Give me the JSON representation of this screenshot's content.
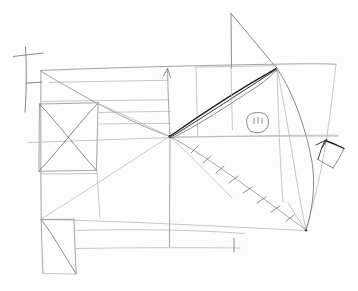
{
  "document": {
    "title": "Hand-drawn geometric sketch",
    "medium": "pencil on paper",
    "width": 358,
    "height": 291,
    "background_color": "#fdfdfc",
    "caption": ""
  },
  "palette": {
    "paper": "#fdfdfc",
    "pencil_light": "#b4b4b6",
    "pencil_mid": "#8e8e90",
    "pencil_strong": "#3a3a3c",
    "pencil_darkest": "#1d1d1f"
  },
  "shapes": {
    "cross": {
      "label": "cross / crucifix mark",
      "vertical": [
        25,
        48,
        27,
        112
      ],
      "horizontal": [
        14,
        56,
        43,
        53
      ],
      "crossbar_low": [
        26,
        83,
        42,
        82
      ]
    },
    "main_body": {
      "label": "large quadrilateral body",
      "points": "41,70 336,64 308,230 41,219"
    },
    "upper_square": {
      "label": "left square with X",
      "points": "40,104 98,103 96,170 39,171",
      "diagonals": [
        [
          40,
          104,
          96,
          170
        ],
        [
          98,
          103,
          39,
          171
        ]
      ]
    },
    "lower_square": {
      "label": "lower-left rectangle with diagonal",
      "points": "41,219 74,219 76,274 43,273",
      "diagonal": [
        41,
        219,
        76,
        274
      ]
    },
    "sail_triangle": {
      "label": "upper-right triangle (sail/fin)",
      "points": "231,13 277,68 231,68"
    },
    "tail": {
      "label": "small dark quadrilateral tail at right",
      "points": "330,143 345,142 340,165 324,162"
    },
    "eye_blob": {
      "label": "small oval with interior marks",
      "cx": 258,
      "cy": 122,
      "rx": 11,
      "ry": 9,
      "marks": [
        [
          254,
          118,
          254,
          124
        ],
        [
          258,
          117,
          258,
          123
        ],
        [
          262,
          118,
          262,
          124
        ]
      ]
    }
  },
  "convergence_points": [
    {
      "name": "center-hub",
      "x": 170,
      "y": 136
    },
    {
      "name": "upper-right-hub",
      "x": 277,
      "y": 68
    },
    {
      "name": "lower-right-hub",
      "x": 306,
      "y": 230
    }
  ],
  "tick_marks": {
    "label": "tick marks along the center-to-lower-right diagonal",
    "count": 8,
    "isolated_tick": [
      234,
      238,
      234,
      252
    ]
  },
  "arrow": {
    "label": "upward arrowhead on the vertical center line",
    "tip": [
      167,
      68
    ]
  }
}
